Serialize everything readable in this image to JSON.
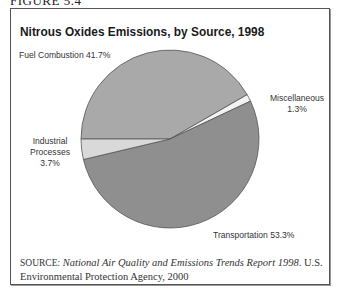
{
  "figure": {
    "label": "FIGURE 5.4",
    "title": "Nitrous Oxides Emissions, by Source, 1998",
    "source_prefix": "SOURCE:",
    "source_title": "National Air Quality and Emissions Trends Report 1998",
    "source_rest": ". U.S. Environmental Protection Agency, 2000"
  },
  "labels": {
    "fuel": "Fuel Combustion 41.7%",
    "misc_name": "Miscellaneous",
    "misc_value": "1.3%",
    "industrial_name_1": "Industrial",
    "industrial_name_2": "Processes",
    "industrial_value": "3.7%",
    "transport": "Transportation 53.3%"
  },
  "colors": {
    "fuel": "#a9a9a9",
    "misc": "#f2f2f2",
    "transport": "#8f8f8f",
    "industrial": "#d9d9d9",
    "outline": "#555555"
  },
  "chart_data": {
    "type": "pie",
    "title": "Nitrous Oxides Emissions, by Source, 1998",
    "categories": [
      "Fuel Combustion",
      "Miscellaneous",
      "Transportation",
      "Industrial Processes"
    ],
    "values": [
      41.7,
      1.3,
      53.3,
      3.7
    ],
    "unit": "%",
    "legend": "none (direct labels)",
    "source": "National Air Quality and Emissions Trends Report 1998. U.S. Environmental Protection Agency, 2000"
  }
}
